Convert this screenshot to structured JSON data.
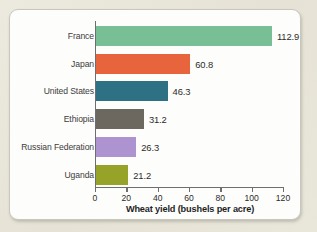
{
  "chart_data": {
    "type": "bar",
    "orientation": "horizontal",
    "title": "",
    "xlabel": "Wheat yield (bushels per acre)",
    "ylabel": "",
    "categories": [
      "France",
      "Japan",
      "United States",
      "Ethiopia",
      "Russian Federation",
      "Uganda"
    ],
    "values": [
      112.9,
      60.8,
      46.3,
      31.2,
      26.3,
      21.2
    ],
    "value_labels": [
      "112.9",
      "60.8",
      "46.3",
      "31.2",
      "26.3",
      "21.2"
    ],
    "colors": [
      "#78bf96",
      "#e8643c",
      "#2e7184",
      "#6d685f",
      "#ad93cf",
      "#97a228"
    ],
    "xlim": [
      0,
      120
    ],
    "xticks": [
      0,
      20,
      40,
      60,
      80,
      100,
      120
    ],
    "xtick_labels": [
      "0",
      "20",
      "40",
      "60",
      "80",
      "100",
      "120"
    ],
    "grid": false,
    "legend": false
  },
  "style": {
    "page_background": "#e9e7dd",
    "card_background": "#fdfdfb",
    "axis_color": "#6e6e6e",
    "text_color": "#2b2b2b"
  }
}
